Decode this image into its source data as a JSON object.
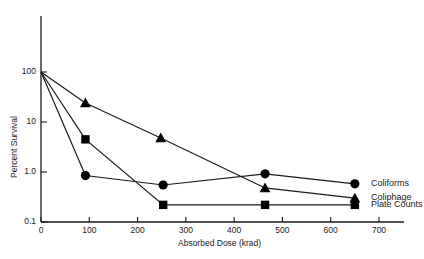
{
  "chart_data": {
    "type": "line",
    "title": "",
    "xlabel": "Absorbed Dose (krad)",
    "ylabel": "Percent Survival",
    "xlim": [
      0,
      700
    ],
    "ylim": [
      0.1,
      100
    ],
    "yscale": "log",
    "grid": false,
    "legend_position": "right-inline",
    "x_ticks": [
      0,
      100,
      200,
      300,
      400,
      500,
      600,
      700
    ],
    "x_tick_labels": [
      "0",
      "100",
      "200",
      "300",
      "400",
      "500",
      "600",
      "700"
    ],
    "y_ticks": [
      0.1,
      1.0,
      10,
      100
    ],
    "y_tick_labels": [
      "0.1",
      "1.0",
      "10",
      "100"
    ],
    "series": [
      {
        "name": "Coliforms",
        "marker": "circle",
        "x": [
          0,
          92,
          253,
          464,
          650
        ],
        "values": [
          100,
          0.85,
          0.55,
          0.92,
          0.58
        ]
      },
      {
        "name": "Coliphage",
        "marker": "triangle",
        "x": [
          0,
          92,
          248,
          464,
          650
        ],
        "values": [
          100,
          24,
          4.8,
          0.48,
          0.3
        ]
      },
      {
        "name": "Plate Counts",
        "marker": "square",
        "x": [
          0,
          92,
          253,
          464,
          650
        ],
        "values": [
          100,
          4.5,
          0.22,
          0.22,
          0.22
        ]
      }
    ]
  },
  "axis": {
    "x_title": "Absorbed Dose (krad)",
    "y_title": "Percent Survival"
  },
  "legend": {
    "entries": [
      {
        "label": "Coliforms",
        "marker": "circle"
      },
      {
        "label": "Coliphage",
        "marker": "triangle"
      },
      {
        "label": "Plate Counts",
        "marker": "square"
      }
    ]
  },
  "colors": {
    "axis": "#1a1a1a",
    "line": "#1a1a1a",
    "marker": "#000000",
    "background": "#ffffff",
    "text": "#1a1a1a"
  }
}
